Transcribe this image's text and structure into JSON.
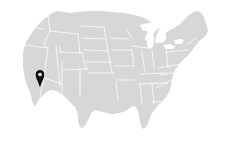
{
  "widget": {
    "title": "United States location map",
    "background_color": "#ffffff"
  },
  "map": {
    "region_label": "United States of America",
    "projection_label": "Contiguous United States",
    "land_color": "#d7d7d7",
    "border_color": "#ffffff",
    "water_color": "#ffffff",
    "show_state_borders": true,
    "show_labels": false,
    "zoom_level": "country"
  },
  "markers": [
    {
      "id": "marker-1",
      "icon": "map-pin-icon",
      "label": "Southern California",
      "color": "#111111",
      "x_pct": 17.7,
      "y_pct": 59.2
    }
  ],
  "legend": {
    "visible": false,
    "entries": []
  }
}
